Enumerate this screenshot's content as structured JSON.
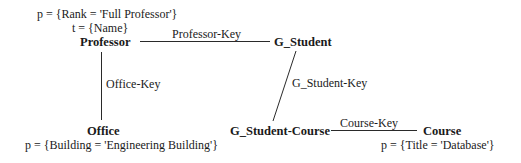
{
  "diagram": {
    "nodes": {
      "professor": {
        "label": "Professor",
        "predicate": "p = {Rank = 'Full Professor'}",
        "target": "t = {Name}"
      },
      "g_student": {
        "label": "G_Student"
      },
      "office": {
        "label": "Office",
        "predicate": "p = {Building = 'Engineering Building'}"
      },
      "g_student_course": {
        "label": "G_Student-Course"
      },
      "course": {
        "label": "Course",
        "predicate": "p = {Title = 'Database'}"
      }
    },
    "edges": {
      "professor_g_student": {
        "label": "Professor-Key"
      },
      "professor_office": {
        "label": "Office-Key"
      },
      "g_student_g_student_course": {
        "label": "G_Student-Key"
      },
      "g_student_course_course": {
        "label": "Course-Key"
      }
    }
  }
}
